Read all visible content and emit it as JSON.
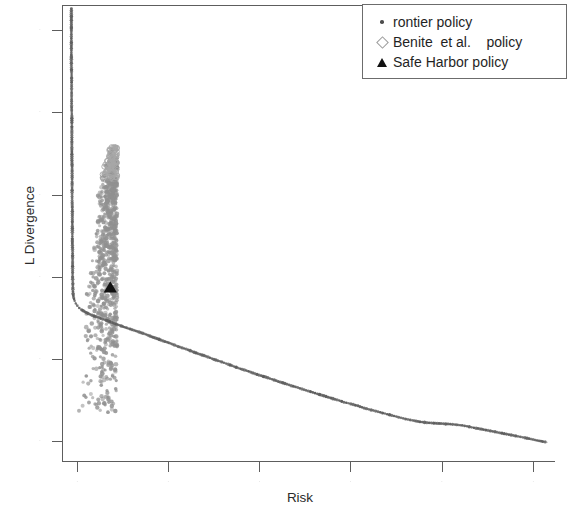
{
  "chart_data": {
    "type": "scatter",
    "title": "",
    "xlabel": "Risk",
    "ylabel": "L Divergence",
    "grid": false,
    "legend_position": "top-right",
    "xlim": [
      0,
      1
    ],
    "ylim": [
      0,
      1
    ],
    "x_tick_labels": [
      "",
      "",
      "",
      "",
      "",
      ""
    ],
    "y_tick_labels": [
      "",
      "",
      "",
      "",
      "",
      ""
    ],
    "x_tick_positions": [
      0.03,
      0.215,
      0.4,
      0.585,
      0.77,
      0.955
    ],
    "y_tick_positions": [
      0.945,
      0.765,
      0.585,
      0.405,
      0.225,
      0.045
    ],
    "series": [
      {
        "name": "rontier policy",
        "marker": "filled-dot",
        "color": "#5a5a5a",
        "points": [
          [
            0.019,
            0.992
          ],
          [
            0.019,
            0.975
          ],
          [
            0.019,
            0.958
          ],
          [
            0.019,
            0.941
          ],
          [
            0.019,
            0.922
          ],
          [
            0.019,
            0.905
          ],
          [
            0.019,
            0.886
          ],
          [
            0.019,
            0.868
          ],
          [
            0.0195,
            0.849
          ],
          [
            0.0195,
            0.831
          ],
          [
            0.0195,
            0.812
          ],
          [
            0.0195,
            0.794
          ],
          [
            0.0195,
            0.775
          ],
          [
            0.02,
            0.757
          ],
          [
            0.02,
            0.738
          ],
          [
            0.02,
            0.72
          ],
          [
            0.02,
            0.701
          ],
          [
            0.02,
            0.683
          ],
          [
            0.02,
            0.664
          ],
          [
            0.0205,
            0.646
          ],
          [
            0.0205,
            0.627
          ],
          [
            0.0205,
            0.609
          ],
          [
            0.0205,
            0.59
          ],
          [
            0.0205,
            0.572
          ],
          [
            0.021,
            0.553
          ],
          [
            0.021,
            0.535
          ],
          [
            0.021,
            0.516
          ],
          [
            0.021,
            0.498
          ],
          [
            0.021,
            0.479
          ],
          [
            0.0215,
            0.461
          ],
          [
            0.0215,
            0.442
          ],
          [
            0.0215,
            0.424
          ],
          [
            0.0215,
            0.405
          ],
          [
            0.022,
            0.39
          ],
          [
            0.022,
            0.378
          ],
          [
            0.0225,
            0.368
          ],
          [
            0.0235,
            0.36
          ],
          [
            0.0255,
            0.353
          ],
          [
            0.028,
            0.347
          ],
          [
            0.031,
            0.342
          ],
          [
            0.035,
            0.337
          ],
          [
            0.04,
            0.333
          ],
          [
            0.046,
            0.329
          ],
          [
            0.053,
            0.325
          ],
          [
            0.061,
            0.321
          ],
          [
            0.069,
            0.318
          ],
          [
            0.078,
            0.314
          ],
          [
            0.087,
            0.311
          ],
          [
            0.097,
            0.307
          ],
          [
            0.107,
            0.303
          ],
          [
            0.117,
            0.299
          ],
          [
            0.127,
            0.295
          ],
          [
            0.138,
            0.291
          ],
          [
            0.149,
            0.287
          ],
          [
            0.16,
            0.283
          ],
          [
            0.171,
            0.279
          ],
          [
            0.182,
            0.274
          ],
          [
            0.193,
            0.27
          ],
          [
            0.205,
            0.265
          ],
          [
            0.216,
            0.261
          ],
          [
            0.228,
            0.256
          ],
          [
            0.24,
            0.251
          ],
          [
            0.252,
            0.247
          ],
          [
            0.264,
            0.242
          ],
          [
            0.276,
            0.237
          ],
          [
            0.288,
            0.233
          ],
          [
            0.3,
            0.228
          ],
          [
            0.312,
            0.223
          ],
          [
            0.324,
            0.219
          ],
          [
            0.337,
            0.214
          ],
          [
            0.349,
            0.209
          ],
          [
            0.362,
            0.204
          ],
          [
            0.374,
            0.2
          ],
          [
            0.387,
            0.195
          ],
          [
            0.4,
            0.19
          ],
          [
            0.413,
            0.186
          ],
          [
            0.426,
            0.181
          ],
          [
            0.439,
            0.176
          ],
          [
            0.452,
            0.172
          ],
          [
            0.465,
            0.167
          ],
          [
            0.478,
            0.163
          ],
          [
            0.491,
            0.158
          ],
          [
            0.504,
            0.154
          ],
          [
            0.518,
            0.149
          ],
          [
            0.531,
            0.145
          ],
          [
            0.545,
            0.14
          ],
          [
            0.558,
            0.136
          ],
          [
            0.572,
            0.131
          ],
          [
            0.586,
            0.127
          ],
          [
            0.6,
            0.123
          ],
          [
            0.613,
            0.118
          ],
          [
            0.627,
            0.114
          ],
          [
            0.641,
            0.11
          ],
          [
            0.655,
            0.106
          ],
          [
            0.669,
            0.102
          ],
          [
            0.683,
            0.098
          ],
          [
            0.697,
            0.094
          ],
          [
            0.711,
            0.091
          ],
          [
            0.726,
            0.088
          ],
          [
            0.74,
            0.086
          ],
          [
            0.754,
            0.085
          ],
          [
            0.769,
            0.084
          ],
          [
            0.783,
            0.083
          ],
          [
            0.797,
            0.082
          ],
          [
            0.812,
            0.08
          ],
          [
            0.826,
            0.077
          ],
          [
            0.84,
            0.074
          ],
          [
            0.855,
            0.071
          ],
          [
            0.869,
            0.068
          ],
          [
            0.883,
            0.065
          ],
          [
            0.897,
            0.062
          ],
          [
            0.911,
            0.059
          ],
          [
            0.925,
            0.056
          ],
          [
            0.939,
            0.053
          ],
          [
            0.952,
            0.05
          ],
          [
            0.964,
            0.047
          ],
          [
            0.975,
            0.045
          ],
          [
            0.985,
            0.043
          ]
        ]
      },
      {
        "name": "Benite et al.   policy",
        "marker": "open-diamond",
        "color": "#8f8f8f",
        "cluster": {
          "x_range": [
            0.028,
            0.112
          ],
          "y_range": [
            0.105,
            0.69
          ],
          "count": 900,
          "description": "Dense gray cloud hugging the frontier, widening downward with a sharp vertical right edge"
        }
      },
      {
        "name": "Safe Harbor policy",
        "marker": "filled-triangle",
        "color": "#0d0d0d",
        "points": [
          [
            0.098,
            0.382
          ]
        ]
      }
    ]
  },
  "legend": {
    "items": [
      {
        "label": "rontier policy",
        "marker": "dot-icon"
      },
      {
        "label": "Benite  et al.    policy",
        "marker": "open-diamond-icon"
      },
      {
        "label": "Safe Harbor policy",
        "marker": "triangle-icon"
      }
    ]
  },
  "axes": {
    "x_title": "Risk",
    "y_title": "L Divergence"
  }
}
